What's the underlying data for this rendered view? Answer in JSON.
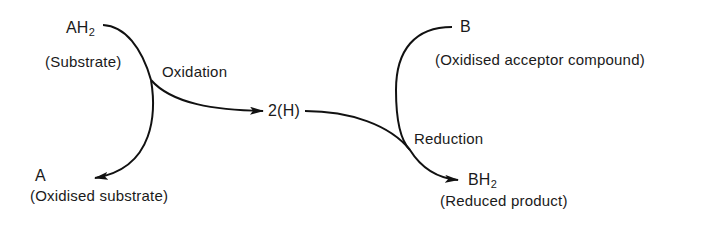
{
  "diagram": {
    "type": "redox-reaction-scheme",
    "nodes": {
      "substrate": {
        "formula": "AH",
        "subscript": "2",
        "description": "(Substrate)"
      },
      "oxidised_substrate": {
        "formula": "A",
        "description": "(Oxidised substrate)"
      },
      "hydrogen": {
        "formula": "2(H)"
      },
      "acceptor": {
        "formula": "B",
        "description": "(Oxidised acceptor compound)"
      },
      "reduced_product": {
        "formula": "BH",
        "subscript": "2",
        "description": "(Reduced product)"
      }
    },
    "processes": {
      "oxidation": "Oxidation",
      "reduction": "Reduction"
    },
    "edges": [
      {
        "from": "AH2",
        "to": "A",
        "via": "Oxidation"
      },
      {
        "from": "AH2",
        "to": "2(H)",
        "via": "Oxidation"
      },
      {
        "from": "2(H)",
        "to": "BH2",
        "via": "Reduction"
      },
      {
        "from": "B",
        "to": "BH2",
        "via": "Reduction"
      }
    ],
    "colors": {
      "line": "#111111",
      "text": "#1a1a1a",
      "background": "#ffffff"
    }
  }
}
